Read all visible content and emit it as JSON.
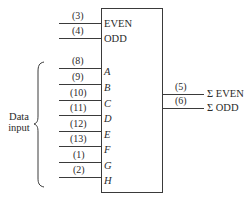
{
  "chip": {
    "control_inputs": [
      {
        "pin": "(3)",
        "label": "EVEN",
        "y": 23
      },
      {
        "pin": "(4)",
        "label": "ODD",
        "y": 38
      }
    ],
    "data_inputs": [
      {
        "pin": "(8)",
        "label": "A",
        "y": 68
      },
      {
        "pin": "(9)",
        "label": "B",
        "y": 84
      },
      {
        "pin": "(10)",
        "label": "C",
        "y": 100
      },
      {
        "pin": "(11)",
        "label": "D",
        "y": 115
      },
      {
        "pin": "(12)",
        "label": "E",
        "y": 131
      },
      {
        "pin": "(13)",
        "label": "F",
        "y": 146
      },
      {
        "pin": "(1)",
        "label": "G",
        "y": 162
      },
      {
        "pin": "(2)",
        "label": "H",
        "y": 177
      }
    ],
    "outputs": [
      {
        "pin": "(5)",
        "label": "Σ EVEN",
        "y": 94
      },
      {
        "pin": "(6)",
        "label": "Σ ODD",
        "y": 108
      }
    ]
  },
  "brace_label": {
    "line1": "Data",
    "line2": "input"
  },
  "colors": {
    "line": "#3a3a3a",
    "text": "#2a2a2a",
    "background": "#ffffff"
  }
}
